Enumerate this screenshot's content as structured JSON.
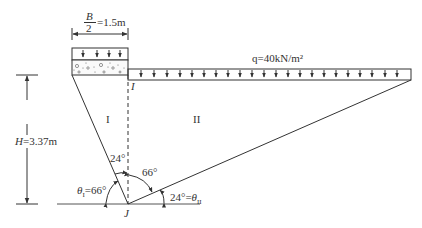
{
  "figure": {
    "width_label": {
      "numerator": "B",
      "denominator": "2",
      "value": "=1.5m"
    },
    "load_label": "q=40kN/m²",
    "height_label": "H=3.37m",
    "region_1": "I",
    "region_2": "II",
    "point_I": "I",
    "point_J": "J",
    "angle_24_top": "24°",
    "angle_66_right": "66°",
    "theta1_label": "θ",
    "theta1_sub": "I",
    "theta1_value": "=66°",
    "theta2_value": "24°=",
    "theta2_label": "θ",
    "theta2_sub": "II"
  },
  "colors": {
    "line": "#3a3a3a",
    "text": "#333333",
    "background": "#ffffff"
  }
}
